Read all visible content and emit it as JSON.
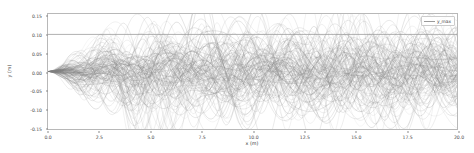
{
  "chart_data": {
    "type": "line",
    "title": "",
    "xlabel": "x (m)",
    "ylabel": "y (m)",
    "xlim": [
      0.0,
      20.0
    ],
    "ylim": [
      -0.155,
      0.155
    ],
    "xticks": [
      "0.0",
      "2.5",
      "5.0",
      "7.5",
      "10.0",
      "12.5",
      "15.0",
      "17.5",
      "20.0"
    ],
    "xtick_values": [
      0.0,
      2.5,
      5.0,
      7.5,
      10.0,
      12.5,
      15.0,
      17.5,
      20.0
    ],
    "yticks": [
      "0.15",
      "0.10",
      "0.05",
      "0.00",
      "-0.05",
      "-0.10",
      "-0.15"
    ],
    "ytick_values": [
      0.15,
      0.1,
      0.05,
      0.0,
      -0.05,
      -0.1,
      -0.15
    ],
    "grid": false,
    "legend_position": "upper right",
    "legend": [
      {
        "name": "y_max",
        "color": "#9a9a9a",
        "style": "solid"
      }
    ],
    "annotations": [
      {
        "kind": "horizontal-reference-line",
        "name": "y_max",
        "y": 0.1,
        "x_start": 0.0,
        "x_end": 20.0,
        "color": "#9a9a9a"
      }
    ],
    "series_summary": {
      "name": "ray trajectories",
      "count": 120,
      "color": "#808080",
      "opacity": 0.45,
      "linewidth": 0.35,
      "description": "bundle of oscillating ray paths launched from the origin, envelope spreading with x",
      "x_start": 0.0,
      "y_start": 0.0,
      "envelope": {
        "x": [
          0.0,
          1.0,
          2.5,
          5.0,
          7.5,
          10.0,
          12.5,
          15.0,
          17.5,
          20.0
        ],
        "upper": [
          0.0,
          0.045,
          0.085,
          0.105,
          0.125,
          0.115,
          0.118,
          0.128,
          0.112,
          0.108
        ],
        "lower": [
          0.0,
          -0.045,
          -0.082,
          -0.148,
          -0.112,
          -0.118,
          -0.112,
          -0.108,
          -0.115,
          -0.105
        ]
      },
      "y_min_observed": -0.148,
      "y_max_observed": 0.132
    }
  }
}
